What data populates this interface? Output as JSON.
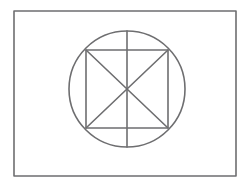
{
  "page": {
    "background_color": "#ffffff",
    "width": 251,
    "height": 187
  },
  "figure": {
    "stroke_color": "#6e6e70",
    "stroke_width": 1.6,
    "frame": {
      "name": "outer-rectangle",
      "x": 14,
      "y": 11,
      "width": 222,
      "height": 165
    },
    "circle": {
      "name": "circle",
      "center_x": 127,
      "center_y": 89,
      "radius": 58
    },
    "square": {
      "name": "inscribed-square",
      "x": 86,
      "y": 50,
      "width": 82,
      "height": 78
    },
    "diagonals": [
      {
        "name": "diagonal-tl-br",
        "x1": 86,
        "y1": 50,
        "x2": 168,
        "y2": 128
      },
      {
        "name": "diagonal-tr-bl",
        "x1": 168,
        "y1": 50,
        "x2": 86,
        "y2": 128
      }
    ],
    "vertical_axis": {
      "name": "vertical-diameter",
      "x1": 127,
      "y1": 31,
      "x2": 127,
      "y2": 147
    }
  }
}
